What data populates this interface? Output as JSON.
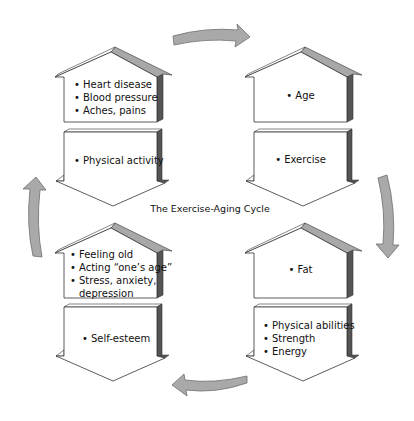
{
  "diagram": {
    "title": "The Exercise-Aging Cycle",
    "colors": {
      "outline": "#333333",
      "shadow_dark": "#555555",
      "roof_gray": "#a8a8a8",
      "arrow_fill": "#a9a9a9",
      "arrow_stroke": "#6e6e6e",
      "box_fill": "#ffffff"
    },
    "quadrants": {
      "top_left": {
        "house": {
          "items": [
            "Heart disease",
            "Blood pressure",
            "Aches, pains"
          ]
        },
        "arrow_box": {
          "items": [
            "Physical activity"
          ]
        }
      },
      "top_right": {
        "house": {
          "items": [
            "Age"
          ]
        },
        "arrow_box": {
          "items": [
            "Exercise"
          ]
        }
      },
      "bottom_right": {
        "house": {
          "items": [
            "Fat"
          ]
        },
        "arrow_box": {
          "items": [
            "Physical abilities",
            "Strength",
            "Energy"
          ]
        }
      },
      "bottom_left": {
        "house": {
          "items": [
            "Feeling old",
            "Acting “one’s age”",
            "Stress, anxiety,",
            "depression"
          ]
        },
        "arrow_box": {
          "items": [
            "Self-esteem"
          ]
        }
      }
    },
    "cycle_arrows": [
      {
        "position": "top",
        "direction": "right",
        "icon": "curved-arrow-right"
      },
      {
        "position": "right",
        "direction": "down",
        "icon": "curved-arrow-down"
      },
      {
        "position": "bottom",
        "direction": "left",
        "icon": "curved-arrow-left"
      },
      {
        "position": "left",
        "direction": "up",
        "icon": "curved-arrow-up"
      }
    ]
  }
}
